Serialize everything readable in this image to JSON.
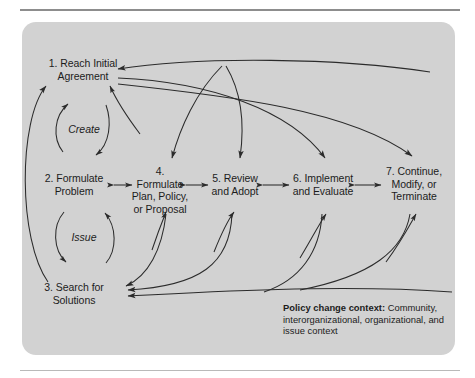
{
  "figure": {
    "background_color": "#ffffff",
    "panel_color": "#d2d2d2",
    "line_color": "#2b2b2b",
    "text_color": "#1c1c1c"
  },
  "nodes": [
    {
      "id": "node-1",
      "label": "1. Reach Initial\nAgreement",
      "line1": "1. Reach Initial",
      "line2": "Agreement"
    },
    {
      "id": "node-2",
      "label": "2. Formulate\nProblem",
      "line1": "2. Formulate",
      "line2": "Problem"
    },
    {
      "id": "node-3",
      "label": "3. Search for\nSolutions",
      "line1": "3. Search for",
      "line2": "Solutions"
    },
    {
      "id": "node-4",
      "label": "4. Formulate\nPlan, Policy,\nor Proposal",
      "line1": "4. Formulate",
      "line2": "Plan, Policy,",
      "line3": "or Proposal"
    },
    {
      "id": "node-5",
      "label": "5. Review\nand Adopt",
      "line1": "5. Review",
      "line2": "and Adopt"
    },
    {
      "id": "node-6",
      "label": "6. Implement\nand Evaluate",
      "line1": "6. Implement",
      "line2": "and Evaluate"
    },
    {
      "id": "node-7",
      "label": "7. Continue,\nModify, or\nTerminate",
      "line1": "7. Continue,",
      "line2": "Modify, or",
      "line3": "Terminate"
    }
  ],
  "loops": [
    {
      "id": "loop-create",
      "label": "Create"
    },
    {
      "id": "loop-issue",
      "label": "Issue"
    }
  ],
  "caption": {
    "bold_label": "Policy change context:",
    "body": " Community, interorganizational, organizational, and issue context",
    "full": "Policy change context: Community, interorganizational, organizational, and issue context"
  }
}
